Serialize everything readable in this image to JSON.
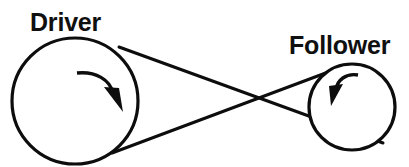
{
  "diagram": {
    "background_color": "#ffffff",
    "stroke_color": "#0d0d0d",
    "width": 409,
    "height": 167,
    "labels": {
      "driver": "Driver",
      "follower": "Follower"
    },
    "pulleys": [
      {
        "id": "driver",
        "label": "Driver",
        "center_x": 75,
        "center_y": 101,
        "radius": 63,
        "rotation": "clockwise",
        "label_x": 30,
        "label_y": 30
      },
      {
        "id": "follower",
        "label": "Follower",
        "center_x": 352,
        "center_y": 107,
        "radius": 43,
        "rotation": "counter-clockwise",
        "label_x": 288,
        "label_y": 53
      }
    ],
    "belt": {
      "type": "crossed",
      "crossing_x": 242,
      "crossing_y": 107,
      "segments": [
        {
          "id": "upper-belt",
          "from_x": 118,
          "from_y": 48,
          "to_x": 381,
          "to_y": 142
        },
        {
          "id": "lower-belt",
          "from_x": 113,
          "from_y": 152,
          "to_x": 331,
          "to_y": 72
        }
      ]
    }
  }
}
